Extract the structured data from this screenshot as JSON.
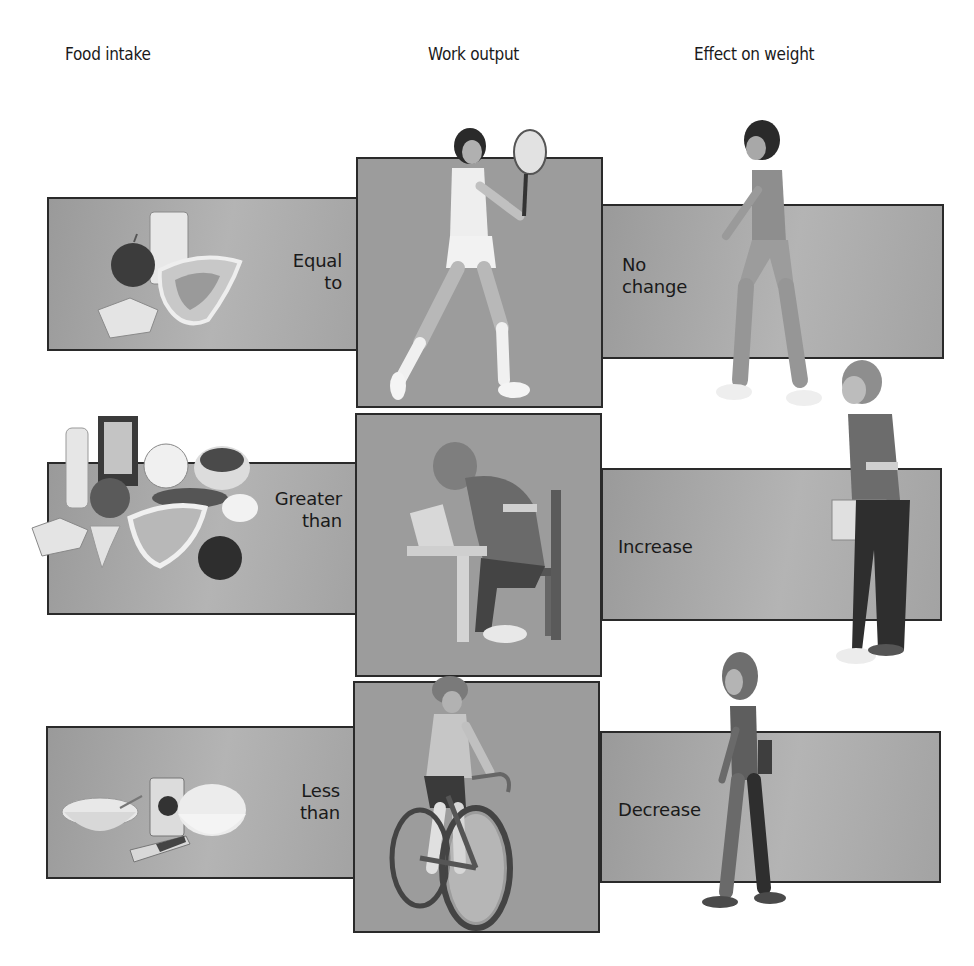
{
  "headers": {
    "food_intake": "Food intake",
    "work_output": "Work output",
    "effect_on_weight": "Effect on weight"
  },
  "rows": [
    {
      "comparison": [
        "Equal",
        "to"
      ],
      "food_items": [
        "apple",
        "glass of milk",
        "steak",
        "slice of bread"
      ],
      "activity": "tennis player",
      "effect": [
        "No",
        "change"
      ],
      "person": "average-build man walking"
    },
    {
      "comparison": [
        "Greater",
        "than"
      ],
      "food_items": [
        "milkshake",
        "television",
        "orange slice",
        "cake",
        "tomato",
        "sausage",
        "steak",
        "fried egg",
        "bread",
        "cocktail",
        "apple"
      ],
      "activity": "student reading at desk",
      "effect": [
        "Increase"
      ],
      "person": "heavier man standing with book"
    },
    {
      "comparison": [
        "Less",
        "than"
      ],
      "food_items": [
        "cereal bowl",
        "soda can",
        "popcorn bowl",
        "candy bar"
      ],
      "activity": "cyclist",
      "effect": [
        "Decrease"
      ],
      "person": "thin woman walking"
    }
  ],
  "colors": {
    "panel_grey": "#a6a6a6",
    "center_grey": "#9c9c9c",
    "border": "#2a2a2a",
    "text": "#1a1a1a"
  }
}
